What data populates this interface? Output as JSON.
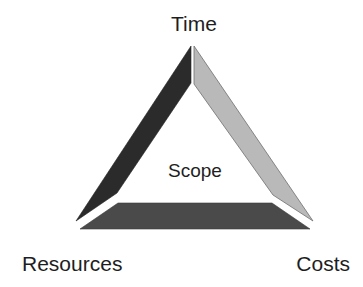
{
  "diagram": {
    "type": "project-management-triangle",
    "center_label": "Scope",
    "vertices": {
      "top": "Time",
      "bottom_left": "Resources",
      "bottom_right": "Costs"
    },
    "sides": [
      {
        "name": "left",
        "between": [
          "Time",
          "Resources"
        ],
        "color": "#2b2b2b"
      },
      {
        "name": "right",
        "between": [
          "Time",
          "Costs"
        ],
        "color": "#b9b9b9",
        "stroke": "#6e6e6e"
      },
      {
        "name": "bottom",
        "between": [
          "Resources",
          "Costs"
        ],
        "color": "#4a4a4a"
      }
    ]
  }
}
